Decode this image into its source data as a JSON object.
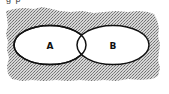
{
  "diagram": {
    "type": "venn",
    "caption_fragment": "g  p",
    "background_pattern": "stippled-gray",
    "colors": {
      "background_dots": "#8a8a8a",
      "background_light": "#d8d8d8",
      "ellipse_fill": "#ffffff",
      "ellipse_stroke": "#111111",
      "page": "#ffffff"
    },
    "sets": [
      {
        "id": "A",
        "label": "A"
      },
      {
        "id": "B",
        "label": "B"
      }
    ],
    "overlap": {
      "sets": [
        "A",
        "B"
      ],
      "label": ""
    }
  }
}
